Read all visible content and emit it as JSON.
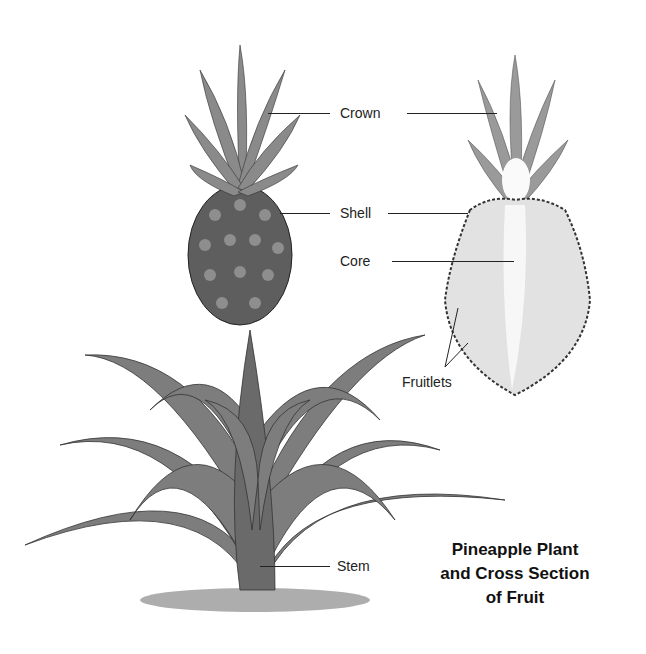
{
  "title": {
    "line1": "Pineapple Plant",
    "line2": "and Cross Section",
    "line3": "of Fruit"
  },
  "labels": {
    "crown": "Crown",
    "shell": "Shell",
    "core": "Core",
    "fruitlets": "Fruitlets",
    "stem": "Stem"
  },
  "colors": {
    "ink": "#222222",
    "leaf": "#7a7a7a",
    "fruit": "#5a5a5a",
    "flesh": "#e6e6e6",
    "core": "#f8f8f8"
  }
}
